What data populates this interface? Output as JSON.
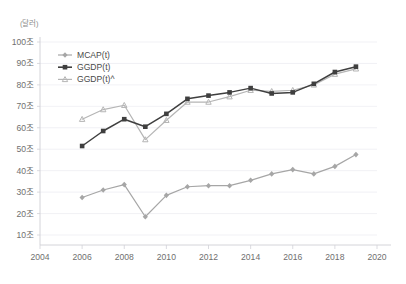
{
  "chart_data": {
    "type": "line",
    "title": "",
    "xlabel": "",
    "ylabel": "",
    "unit_label": "(달러)",
    "xlim": [
      2004,
      2020
    ],
    "ylim": [
      0,
      100
    ],
    "x_ticks": [
      "2004",
      "2006",
      "2008",
      "2010",
      "2012",
      "2014",
      "2016",
      "2018",
      "2020"
    ],
    "y_ticks": [
      "10조",
      "20조",
      "30조",
      "40조",
      "50조",
      "60조",
      "70조",
      "80조",
      "90조",
      "100조"
    ],
    "grid": true,
    "legend_position": "top-left",
    "x": [
      2006,
      2007,
      2008,
      2009,
      2010,
      2011,
      2012,
      2013,
      2014,
      2015,
      2016,
      2017,
      2018,
      2019
    ],
    "series": [
      {
        "name": "MCAP(t)",
        "color": "#a6a6a6",
        "marker": "diamond",
        "values": [
          27.5,
          31.0,
          33.5,
          18.5,
          28.5,
          32.5,
          33.0,
          33.0,
          35.5,
          38.5,
          40.5,
          38.5,
          42.0,
          47.5
        ]
      },
      {
        "name": "GGDP(t)",
        "color": "#3f3f3f",
        "marker": "square",
        "values": [
          51.5,
          58.5,
          64.0,
          60.5,
          66.5,
          73.5,
          75.0,
          76.5,
          78.5,
          76.0,
          76.5,
          80.5,
          86.0,
          88.5
        ]
      },
      {
        "name": "GGDP(t)^",
        "color": "#b5b5b5",
        "marker": "triangle",
        "values": [
          64.0,
          68.5,
          70.5,
          54.5,
          63.5,
          72.0,
          72.0,
          74.5,
          77.5,
          77.0,
          77.5,
          80.0,
          85.0,
          87.5
        ]
      }
    ]
  },
  "legend": {
    "items": [
      {
        "label": "MCAP(t)"
      },
      {
        "label": "GGDP(t)"
      },
      {
        "label": "GGDP(t)^"
      }
    ]
  },
  "axis": {
    "unit": "(달러)"
  },
  "header": {
    "cut_off_title": ""
  }
}
